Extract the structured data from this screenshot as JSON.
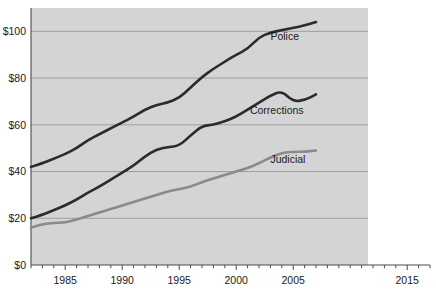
{
  "chart_data": {
    "type": "line",
    "title": "",
    "subtitle": "",
    "xlabel": "",
    "ylabel": "",
    "xlim": [
      1982,
      2017
    ],
    "ylim": [
      0,
      110
    ],
    "grid": true,
    "legend_position": "inline-right",
    "y_ticks": [
      0,
      20,
      40,
      60,
      80,
      100
    ],
    "y_tick_labels": [
      "$0",
      "$20",
      "$40",
      "$60",
      "$80",
      "$100"
    ],
    "x_ticks": [
      1985,
      1990,
      1995,
      2000,
      2005,
      2015
    ],
    "x_tick_labels": [
      "1985",
      "1990",
      "1995",
      "2000",
      "2005",
      "2015"
    ],
    "x_minor_tick_step": 1,
    "x": [
      1982,
      1983,
      1984,
      1985,
      1986,
      1987,
      1988,
      1989,
      1990,
      1991,
      1992,
      1993,
      1994,
      1995,
      1996,
      1997,
      1998,
      1999,
      2000,
      2001,
      2002,
      2003,
      2004,
      2005,
      2006,
      2007
    ],
    "series": [
      {
        "name": "Police",
        "color": "#2b2b2b",
        "width": 2.6,
        "label": "Police",
        "label_x": 2003.0,
        "label_y": 96.5,
        "values": [
          42.0,
          43.5,
          45.5,
          47.5,
          50.0,
          53.5,
          56.0,
          58.5,
          61.0,
          63.5,
          66.5,
          68.5,
          69.5,
          71.5,
          76.0,
          80.5,
          84.0,
          87.0,
          90.0,
          92.5,
          97.5,
          99.5,
          100.5,
          101.5,
          102.5,
          104.0
        ]
      },
      {
        "name": "Corrections",
        "color": "#2b2b2b",
        "width": 2.6,
        "label": "Corrections",
        "label_x": 2001.2,
        "label_y": 64.5,
        "values": [
          20.0,
          21.5,
          23.5,
          25.5,
          28.0,
          31.0,
          33.5,
          36.5,
          39.5,
          42.5,
          46.5,
          49.5,
          50.5,
          51.0,
          55.5,
          59.5,
          60.0,
          61.5,
          63.5,
          66.5,
          69.5,
          72.5,
          74.5,
          73.0,
          71.5,
          70.0
        ]
      },
      {
        "name": "Judicial",
        "color": "#8a8a8a",
        "width": 2.6,
        "label": "Judicial",
        "label_x": 2003.0,
        "label_y": 43.5,
        "values": [
          16.0,
          17.5,
          18.0,
          18.2,
          19.5,
          21.0,
          22.5,
          24.0,
          25.5,
          27.0,
          28.5,
          30.0,
          31.5,
          32.5,
          33.5,
          35.5,
          37.0,
          38.5,
          40.0,
          41.5,
          43.5,
          46.0,
          48.0,
          49.5,
          49.5,
          49.0
        ]
      }
    ],
    "series_extra_tail": {
      "Corrections": {
        "x": [
          2005,
          2006,
          2007
        ],
        "values": [
          70.0,
          70.5,
          73.0
        ]
      },
      "Judicial": {
        "x": [
          2005,
          2006,
          2007
        ],
        "values": [
          48.5,
          48.5,
          49.0
        ]
      }
    },
    "colors": {
      "plot_background": "#d4d4d4",
      "page_background": "#ffffff",
      "gridline": "#9a9a9a",
      "axis": "#4a4a4a",
      "text": "#1a1a1a",
      "police": "#2b2b2b",
      "corrections": "#2b2b2b",
      "judicial": "#8a8a8a"
    }
  }
}
